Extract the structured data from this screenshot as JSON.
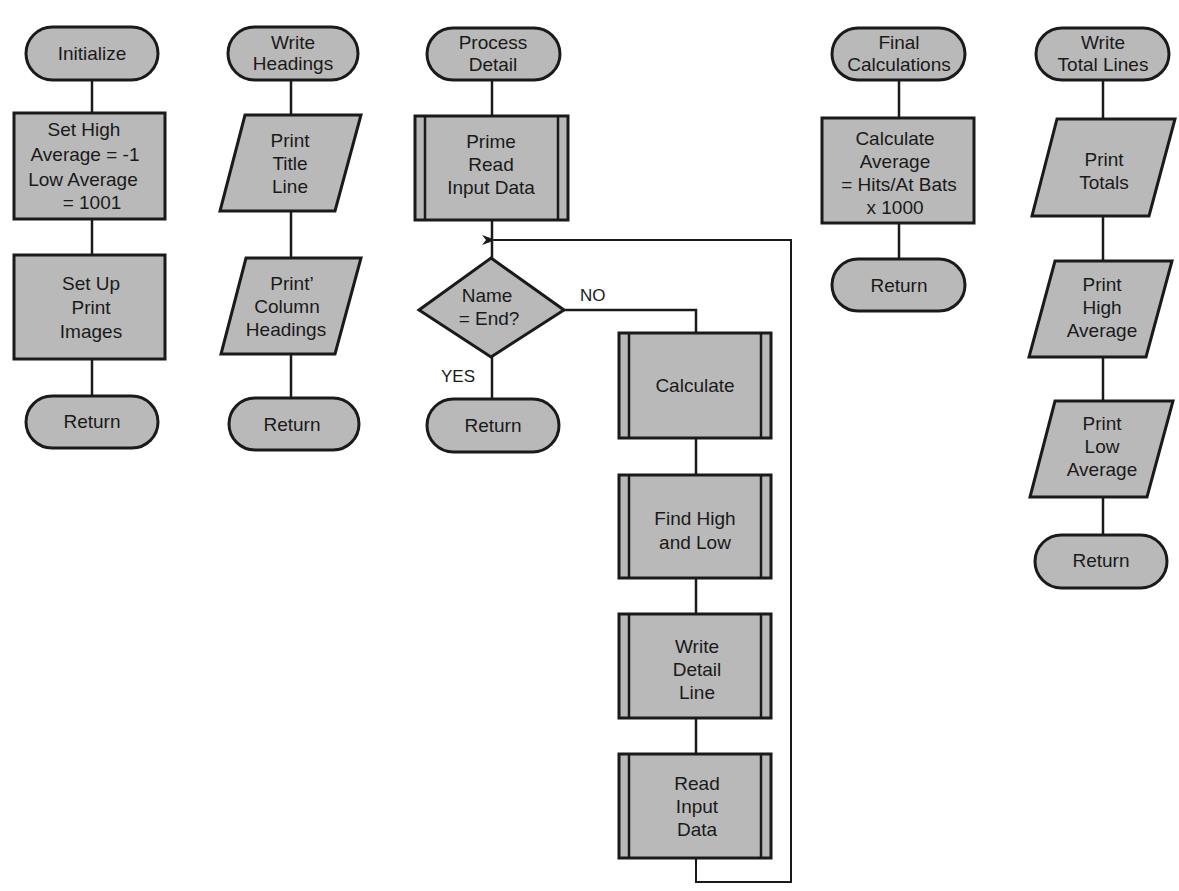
{
  "colors": {
    "fill": "#b9b9b9",
    "stroke": "#1a1a1a",
    "background": "#ffffff"
  },
  "modules": [
    {
      "id": "initialize",
      "nodes": [
        {
          "type": "terminal",
          "lines": [
            "Initialize"
          ]
        },
        {
          "type": "process",
          "lines": [
            "Set High",
            "Average =  -1",
            "Low Average",
            "=  1001"
          ]
        },
        {
          "type": "process",
          "lines": [
            "Set Up",
            "Print",
            "Images"
          ]
        },
        {
          "type": "terminal",
          "lines": [
            "Return"
          ]
        }
      ]
    },
    {
      "id": "write-headings",
      "nodes": [
        {
          "type": "terminal",
          "lines": [
            "Write",
            "Headings"
          ]
        },
        {
          "type": "io",
          "lines": [
            "Print",
            "Title",
            "Line"
          ]
        },
        {
          "type": "io",
          "lines": [
            "Print’",
            "Column",
            "Headings"
          ]
        },
        {
          "type": "terminal",
          "lines": [
            "Return"
          ]
        }
      ]
    },
    {
      "id": "process-detail",
      "nodes": [
        {
          "type": "terminal",
          "lines": [
            "Process",
            "Detail"
          ]
        },
        {
          "type": "predefined",
          "lines": [
            "Prime",
            "Read",
            "Input Data"
          ]
        },
        {
          "type": "decision",
          "lines": [
            "Name",
            "= End?"
          ]
        },
        {
          "type": "terminal",
          "lines": [
            "Return"
          ]
        },
        {
          "type": "predefined",
          "lines": [
            "Calculate"
          ]
        },
        {
          "type": "predefined",
          "lines": [
            "Find High",
            "and Low"
          ]
        },
        {
          "type": "predefined",
          "lines": [
            "Write",
            "Detail",
            "Line"
          ]
        },
        {
          "type": "predefined",
          "lines": [
            "Read",
            "Input",
            "Data"
          ]
        }
      ],
      "branch_labels": {
        "no": "NO",
        "yes": "YES"
      }
    },
    {
      "id": "final-calculations",
      "nodes": [
        {
          "type": "terminal",
          "lines": [
            "Final",
            "Calculations"
          ]
        },
        {
          "type": "process",
          "lines": [
            "Calculate",
            "Average",
            "=  Hits/At Bats",
            "x 1000"
          ]
        },
        {
          "type": "terminal",
          "lines": [
            "Return"
          ]
        }
      ]
    },
    {
      "id": "write-total-lines",
      "nodes": [
        {
          "type": "terminal",
          "lines": [
            "Write",
            "Total Lines"
          ]
        },
        {
          "type": "io",
          "lines": [
            "Print",
            "Totals"
          ]
        },
        {
          "type": "io",
          "lines": [
            "Print",
            "High",
            "Average"
          ]
        },
        {
          "type": "io",
          "lines": [
            "Print",
            "Low",
            "Average"
          ]
        },
        {
          "type": "terminal",
          "lines": [
            "Return"
          ]
        }
      ]
    }
  ]
}
